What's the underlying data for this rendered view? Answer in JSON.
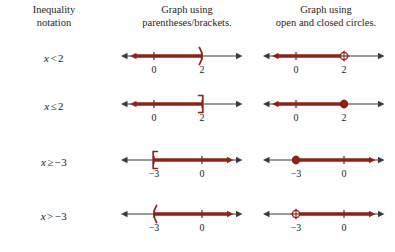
{
  "header": {
    "col1_line1": "Inequality",
    "col1_line2": "notation",
    "col2_line1": "Graph using",
    "col2_line2": "parentheses/brackets.",
    "col3_line1": "Graph using",
    "col3_line2": "open and closed circles."
  },
  "colors": {
    "axis": "#3a3a3a",
    "highlight": "#8c2219",
    "text": "#1a1a1a"
  },
  "rows": [
    {
      "id": "row-x-lt-2",
      "inequality": {
        "var": "x",
        "op": "<",
        "value": "2"
      },
      "inequality_text": "x < 2",
      "bracket_graph": {
        "endpoint_symbol": ")",
        "endpoint_value": "2",
        "direction": "left",
        "ticks": [
          {
            "label": "0",
            "x": 40
          },
          {
            "label": "2",
            "x": 88
          }
        ]
      },
      "circle_graph": {
        "endpoint_symbol": "open-circle",
        "endpoint_value": "2",
        "direction": "left",
        "ticks": [
          {
            "label": "0",
            "x": 40
          },
          {
            "label": "2",
            "x": 88
          }
        ]
      }
    },
    {
      "id": "row-x-le-2",
      "inequality": {
        "var": "x",
        "op": "≤",
        "value": "2"
      },
      "inequality_text": "x ≤ 2",
      "bracket_graph": {
        "endpoint_symbol": "]",
        "endpoint_value": "2",
        "direction": "left",
        "ticks": [
          {
            "label": "0",
            "x": 40
          },
          {
            "label": "2",
            "x": 88
          }
        ]
      },
      "circle_graph": {
        "endpoint_symbol": "closed-circle",
        "endpoint_value": "2",
        "direction": "left",
        "ticks": [
          {
            "label": "0",
            "x": 40
          },
          {
            "label": "2",
            "x": 88
          }
        ]
      }
    },
    {
      "id": "row-x-ge-neg3",
      "inequality": {
        "var": "x",
        "op": "≥",
        "value": "−3"
      },
      "inequality_text": "x ≥ −3",
      "bracket_graph": {
        "endpoint_symbol": "[",
        "endpoint_value": "−3",
        "direction": "right",
        "ticks": [
          {
            "label": "−3",
            "x": 40
          },
          {
            "label": "0",
            "x": 88
          }
        ]
      },
      "circle_graph": {
        "endpoint_symbol": "closed-circle",
        "endpoint_value": "−3",
        "direction": "right",
        "ticks": [
          {
            "label": "−3",
            "x": 40
          },
          {
            "label": "0",
            "x": 88
          }
        ]
      }
    },
    {
      "id": "row-x-gt-neg3",
      "inequality": {
        "var": "x",
        "op": ">",
        "value": "−3"
      },
      "inequality_text": "x > −3",
      "bracket_graph": {
        "endpoint_symbol": "(",
        "endpoint_value": "−3",
        "direction": "right",
        "ticks": [
          {
            "label": "−3",
            "x": 40
          },
          {
            "label": "0",
            "x": 88
          }
        ]
      },
      "circle_graph": {
        "endpoint_symbol": "open-circle",
        "endpoint_value": "−3",
        "direction": "right",
        "ticks": [
          {
            "label": "−3",
            "x": 40
          },
          {
            "label": "0",
            "x": 88
          }
        ]
      }
    }
  ]
}
